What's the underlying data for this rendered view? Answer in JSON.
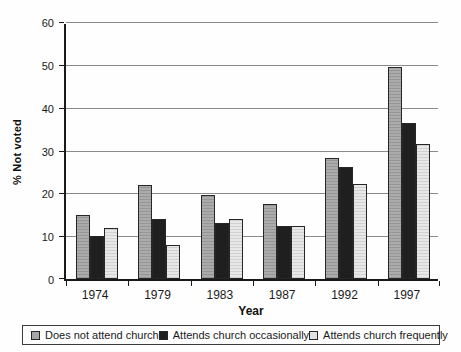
{
  "chart_data": {
    "type": "bar",
    "title": "",
    "xlabel": "Year",
    "ylabel": "% Not voted",
    "ylim": [
      0,
      60
    ],
    "ytick_step": 10,
    "grid": true,
    "legend_position": "bottom",
    "categories": [
      "1974",
      "1979",
      "1983",
      "1987",
      "1992",
      "1997"
    ],
    "series": [
      {
        "name": "Does not attend church",
        "color": "#a6a6a6",
        "values": [
          15,
          22,
          19.5,
          17.5,
          28.2,
          49.4
        ]
      },
      {
        "name": "Attends church occasionally",
        "color": "#1f1f1f",
        "values": [
          10,
          14,
          13,
          12.3,
          26.2,
          36.5
        ]
      },
      {
        "name": "Attends church frequently",
        "color": "#e0e0e0",
        "values": [
          12,
          8,
          14,
          12.3,
          22.2,
          31.5
        ]
      }
    ]
  },
  "colors": {
    "gridline": "#8a8a8a",
    "axis": "#1a1a1a",
    "background": "#fefefe"
  }
}
